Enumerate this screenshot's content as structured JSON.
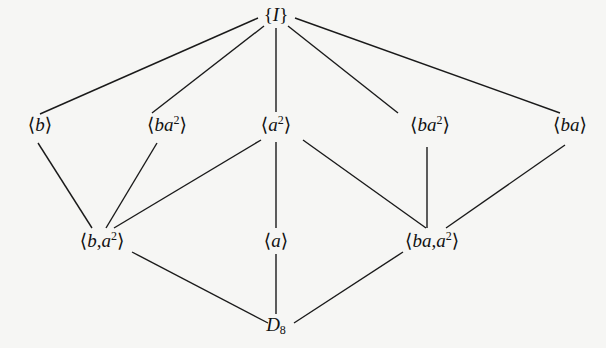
{
  "diagram": {
    "type": "subgroup-lattice",
    "nodes": [
      {
        "id": "identity",
        "label": "{I}",
        "x": 276,
        "y": 14
      },
      {
        "id": "b",
        "label": "⟨b⟩",
        "x": 40,
        "y": 124
      },
      {
        "id": "ba2_left",
        "label": "⟨ba²⟩",
        "x": 167,
        "y": 124
      },
      {
        "id": "a2",
        "label": "⟨a²⟩",
        "x": 276,
        "y": 124
      },
      {
        "id": "ba2_right",
        "label": "⟨ba²⟩",
        "x": 430,
        "y": 124
      },
      {
        "id": "ba",
        "label": "⟨ba⟩",
        "x": 570,
        "y": 124
      },
      {
        "id": "b_a2",
        "label": "⟨b,a²⟩",
        "x": 102,
        "y": 240
      },
      {
        "id": "a",
        "label": "⟨a⟩",
        "x": 276,
        "y": 240
      },
      {
        "id": "ba_a2",
        "label": "⟨ba,a²⟩",
        "x": 432,
        "y": 240
      },
      {
        "id": "D8",
        "label": "D₈",
        "x": 276,
        "y": 325
      }
    ],
    "edges": [
      {
        "from": "identity",
        "to": "b",
        "x1": 258,
        "y1": 18,
        "x2": 40,
        "y2": 114
      },
      {
        "from": "identity",
        "to": "ba2_left",
        "x1": 264,
        "y1": 26,
        "x2": 152,
        "y2": 113
      },
      {
        "from": "identity",
        "to": "a2",
        "x1": 276,
        "y1": 28,
        "x2": 276,
        "y2": 112
      },
      {
        "from": "identity",
        "to": "ba2_right",
        "x1": 288,
        "y1": 26,
        "x2": 398,
        "y2": 113
      },
      {
        "from": "identity",
        "to": "ba",
        "x1": 295,
        "y1": 18,
        "x2": 560,
        "y2": 113
      },
      {
        "from": "b",
        "to": "b_a2",
        "x1": 38,
        "y1": 143,
        "x2": 92,
        "y2": 228
      },
      {
        "from": "ba2_left",
        "to": "b_a2",
        "x1": 157,
        "y1": 143,
        "x2": 106,
        "y2": 228
      },
      {
        "from": "a2",
        "to": "b_a2",
        "x1": 261,
        "y1": 140,
        "x2": 114,
        "y2": 228
      },
      {
        "from": "a2",
        "to": "a",
        "x1": 276,
        "y1": 142,
        "x2": 276,
        "y2": 228
      },
      {
        "from": "a2",
        "to": "ba_a2",
        "x1": 303,
        "y1": 140,
        "x2": 426,
        "y2": 228
      },
      {
        "from": "ba2_right",
        "to": "ba_a2",
        "x1": 427,
        "y1": 147,
        "x2": 427,
        "y2": 228
      },
      {
        "from": "ba",
        "to": "ba_a2",
        "x1": 565,
        "y1": 145,
        "x2": 446,
        "y2": 228
      },
      {
        "from": "b_a2",
        "to": "D8",
        "x1": 132,
        "y1": 252,
        "x2": 268,
        "y2": 323
      },
      {
        "from": "a",
        "to": "D8",
        "x1": 276,
        "y1": 254,
        "x2": 276,
        "y2": 314
      },
      {
        "from": "ba_a2",
        "to": "D8",
        "x1": 403,
        "y1": 252,
        "x2": 294,
        "y2": 323
      }
    ]
  },
  "labels": {
    "identity": {
      "open": "{",
      "var": "I",
      "close": "}"
    },
    "b": {
      "open": "⟨",
      "var": "b",
      "close": "⟩"
    },
    "ba2_left": {
      "open": "⟨",
      "var": "ba",
      "sup": "2",
      "close": "⟩"
    },
    "a2": {
      "open": "⟨",
      "var": "a",
      "sup": "2",
      "close": "⟩"
    },
    "ba2_right": {
      "open": "⟨",
      "var": "ba",
      "sup": "2",
      "close": "⟩"
    },
    "ba": {
      "open": "⟨",
      "var": "ba",
      "close": "⟩"
    },
    "b_a2": {
      "open": "⟨",
      "var": "b",
      "sep": ",",
      "var2": "a",
      "sup": "2",
      "close": "⟩"
    },
    "a": {
      "open": "⟨",
      "var": "a",
      "close": "⟩"
    },
    "ba_a2": {
      "open": "⟨",
      "var": "ba",
      "sep": ",",
      "var2": "a",
      "sup": "2",
      "close": "⟩"
    },
    "D8": {
      "var": "D",
      "sub": "8"
    }
  }
}
